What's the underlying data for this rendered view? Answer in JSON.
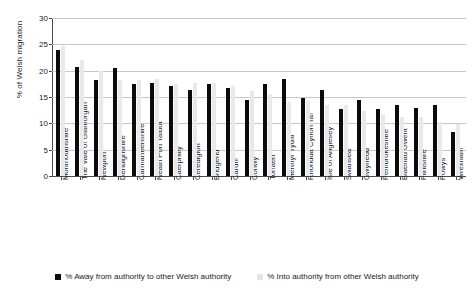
{
  "chart_data": {
    "type": "bar",
    "title": "",
    "xlabel": "",
    "ylabel": "% of Welsh migration",
    "ylim": [
      0,
      30
    ],
    "yticks": [
      0,
      5,
      10,
      15,
      20,
      25,
      30
    ],
    "grid": true,
    "legend_position": "bottom",
    "categories": [
      "Monmouthshire",
      "The Vale of Glamorgan",
      "Newport",
      "Denbighshire",
      "Carmarthenshire",
      "Neath Port Talbot",
      "Caerphilly",
      "Ceredigion",
      "Bridgend",
      "Cardiff",
      "Conwy",
      "Torfaen",
      "Merthyr Tydfil",
      "Rhondda Cynon Taf",
      "Isle of Anglesey",
      "Swansea",
      "Gwynedd",
      "Pembrokeshire",
      "Blaenau Gwent",
      "Flintshire",
      "Powys",
      "Wrexham"
    ],
    "series": [
      {
        "name": "% Away from authority to other Welsh authority",
        "color": "#0b0b0b",
        "values": [
          24.0,
          20.7,
          18.2,
          20.6,
          17.5,
          17.6,
          17.0,
          16.3,
          17.4,
          16.8,
          14.4,
          17.4,
          18.5,
          14.8,
          16.4,
          12.7,
          14.4,
          12.7,
          13.4,
          13.0,
          13.4,
          8.3
        ]
      },
      {
        "name": "% Into authority from other Welsh authority",
        "color": "#e9e9e9",
        "values": [
          24.6,
          22.0,
          19.9,
          18.2,
          18.3,
          18.4,
          17.5,
          17.7,
          17.7,
          17.0,
          16.1,
          15.6,
          14.0,
          14.3,
          13.4,
          13.4,
          12.4,
          11.7,
          11.3,
          11.2,
          10.3,
          9.9
        ]
      }
    ]
  },
  "legend": {
    "items": [
      {
        "label": "% Away from authority to other Welsh authority"
      },
      {
        "label": "% Into authority from other Welsh authority"
      }
    ]
  }
}
